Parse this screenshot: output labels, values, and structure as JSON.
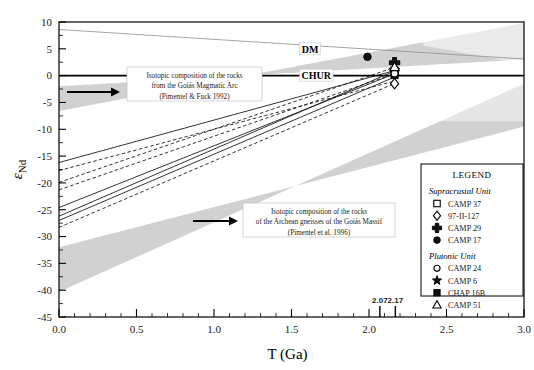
{
  "figure": {
    "background": "#ffffff",
    "frame_color": "#000000"
  },
  "chart_data": {
    "type": "line",
    "title": "",
    "xlabel": "T (Ga)",
    "ylabel": "εNd",
    "xlim": [
      0.0,
      3.0
    ],
    "ylim": [
      -45,
      10
    ],
    "grid": false,
    "legend_position": "bottom-right",
    "x_ticks": [
      "0.0",
      "0.5",
      "1.0",
      "1.5",
      "2.0",
      "2.5",
      "3.0"
    ],
    "x_tick_values": [
      0.0,
      0.5,
      1.0,
      1.5,
      2.0,
      2.5,
      3.0
    ],
    "x_minor_step": 0.1,
    "y_ticks": [
      "10",
      "5",
      "0",
      "-5",
      "-10",
      "-15",
      "-20",
      "-25",
      "-30",
      "-35",
      "-40",
      "-45"
    ],
    "y_tick_values": [
      10,
      5,
      0,
      -5,
      -10,
      -15,
      -20,
      -25,
      -30,
      -35,
      -40,
      -45
    ],
    "special_x_ticks": [
      {
        "label": "2.07",
        "value": 2.07
      },
      {
        "label": "2.17",
        "value": 2.17
      }
    ],
    "reference_lines": [
      {
        "name": "DM",
        "label": "DM",
        "style": "solid-thin",
        "color": "#9a9a9a",
        "points": [
          [
            0.0,
            8.6
          ],
          [
            3.0,
            3.1
          ]
        ],
        "label_x": 1.62,
        "label_y": 4.9
      },
      {
        "name": "CHUR",
        "label": "CHUR",
        "style": "solid-thick",
        "color": "#000000",
        "points": [
          [
            0.0,
            0
          ],
          [
            3.0,
            0
          ]
        ],
        "label_x": 1.66,
        "label_y": 0.0
      }
    ],
    "bands": [
      {
        "name": "goias-magmatic-arc-band",
        "color": "#c9c9c9",
        "opacity": 0.85,
        "points": [
          [
            0.0,
            -2.0
          ],
          [
            0.0,
            -6.6
          ],
          [
            3.0,
            9.8
          ],
          [
            3.0,
            3.0
          ]
        ]
      },
      {
        "name": "archean-gneisses-band",
        "color": "#c9c9c9",
        "opacity": 0.85,
        "points": [
          [
            0.0,
            -32.0
          ],
          [
            0.0,
            -40.3
          ],
          [
            3.0,
            -1.5
          ],
          [
            3.0,
            -9.5
          ]
        ]
      }
    ],
    "evolution_lines": [
      {
        "name": "CAMP 37",
        "style": "solid",
        "points": [
          [
            0.0,
            -16.2
          ],
          [
            2.16,
            0.9
          ]
        ]
      },
      {
        "name": "97-II-127",
        "style": "dashed",
        "points": [
          [
            0.0,
            -17.7
          ],
          [
            2.18,
            -0.9
          ]
        ]
      },
      {
        "name": "CAMP 29",
        "style": "dashed",
        "points": [
          [
            0.0,
            -19.9
          ],
          [
            2.17,
            1.6
          ]
        ]
      },
      {
        "name": "CAMP 17",
        "style": "dashed",
        "points": [
          [
            0.0,
            -21.3
          ],
          [
            2.16,
            0.3
          ]
        ]
      },
      {
        "name": "CAMP 24",
        "style": "solid",
        "points": [
          [
            0.0,
            -24.6
          ],
          [
            2.17,
            0.4
          ]
        ]
      },
      {
        "name": "CAMP 6",
        "style": "solid",
        "points": [
          [
            0.0,
            -26.2
          ],
          [
            2.16,
            0.8
          ]
        ]
      },
      {
        "name": "CHAP 16B",
        "style": "solid",
        "points": [
          [
            0.0,
            -27.0
          ],
          [
            2.17,
            -0.2
          ]
        ]
      },
      {
        "name": "CAMP 51",
        "style": "dashed",
        "points": [
          [
            0.0,
            -28.3
          ],
          [
            2.17,
            -1.4
          ]
        ]
      }
    ],
    "data_points": [
      {
        "name": "CAMP 17",
        "symbol": "filled-circle",
        "x": 1.99,
        "y": 3.5
      },
      {
        "name": "CAMP 29",
        "symbol": "cross",
        "x": 2.165,
        "y": 2.4
      },
      {
        "name": "CAMP 6",
        "symbol": "filled-star",
        "x": 2.165,
        "y": 1.0
      },
      {
        "name": "CHAP 16B",
        "symbol": "filled-square",
        "x": 2.165,
        "y": 0.1
      },
      {
        "name": "CAMP 37",
        "symbol": "open-square",
        "x": 2.165,
        "y": 0.9
      },
      {
        "name": "CAMP 24",
        "symbol": "open-circle",
        "x": 2.165,
        "y": 0.4
      },
      {
        "name": "CAMP 51",
        "symbol": "open-triangle",
        "x": 2.165,
        "y": 1.6
      },
      {
        "name": "97-II-127",
        "symbol": "open-diamond",
        "x": 2.165,
        "y": -1.5
      }
    ]
  },
  "annotations": [
    {
      "name": "goias-magmatic-arc-note",
      "lines": [
        "Isotopic composition of the rocks",
        "from the Goiás Magmatic Arc",
        "(Pimentel & Fuck  1992)"
      ],
      "arrow": true
    },
    {
      "name": "archean-gneisses-note",
      "lines": [
        "Isotopic composition of the rocks",
        "of the Archean gneisses of the Goiás Massif",
        "(Pimentel et al. 1996)"
      ],
      "arrow": true
    }
  ],
  "legend": {
    "title": "LEGEND",
    "groups": [
      {
        "heading": "Supracrustal Unit",
        "items": [
          {
            "symbol": "open-square",
            "label": "CAMP 37"
          },
          {
            "symbol": "open-diamond",
            "label": "97-II-127"
          },
          {
            "symbol": "cross",
            "label": "CAMP 29"
          },
          {
            "symbol": "filled-circle",
            "label": "CAMP 17"
          }
        ]
      },
      {
        "heading": "Plutonic Unit",
        "items": [
          {
            "symbol": "open-circle",
            "label": "CAMP 24"
          },
          {
            "symbol": "filled-star",
            "label": "CAMP 6"
          },
          {
            "symbol": "filled-square",
            "label": "CHAP 16B"
          },
          {
            "symbol": "open-triangle",
            "label": "CAMP 51"
          }
        ]
      }
    ]
  }
}
